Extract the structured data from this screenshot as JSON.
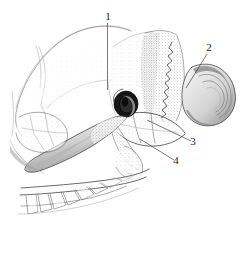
{
  "figure": {
    "kind": "anatomical-line-drawing",
    "background_color": "#ffffff",
    "ink_color": "#3a3a3a",
    "label_color": "#1a1a1a",
    "width": 242,
    "height": 253,
    "technique": "stipple and hatching pen drawing"
  },
  "labels": [
    {
      "id": "label-1",
      "text": "1",
      "text_x": 108,
      "text_y": 20,
      "leader": "M107.5,23 L107.5,90",
      "target": "braincase / parietal region"
    },
    {
      "id": "label-2",
      "text": "2",
      "text_x": 209,
      "text_y": 51,
      "leader": "M207,54 L186,88",
      "target": "occipital / nuchal surface"
    },
    {
      "id": "label-3",
      "text": "3",
      "text_x": 193,
      "text_y": 145,
      "leader": "M191,141 L147,120",
      "target": "paroccipital process"
    },
    {
      "id": "label-4",
      "text": "4",
      "text_x": 176,
      "text_y": 164,
      "leader": "M174,160 L140,139",
      "target": "tympanic bulla / styloid region"
    }
  ],
  "features": [
    {
      "id": "feature-external-acoustic-meatus",
      "name": "external acoustic meatus",
      "note": "dark oval opening, center ~ (126,104)"
    },
    {
      "id": "feature-zygomatic-arch",
      "name": "zygomatic arch",
      "note": "elongated bar sweeping lower-left"
    },
    {
      "id": "feature-occipital-condyle",
      "name": "occipital condyle",
      "note": "rounded layered mass at right edge"
    },
    {
      "id": "feature-tooth-row",
      "name": "tooth row / molars",
      "note": "lower-left, serrated crowns"
    },
    {
      "id": "feature-nuchal-suture",
      "name": "serrated suture",
      "note": "jagged vertical line on occipital plate"
    },
    {
      "id": "feature-braincase",
      "name": "braincase",
      "note": "large pale dome upper-left"
    }
  ]
}
